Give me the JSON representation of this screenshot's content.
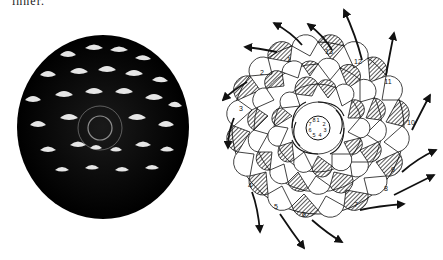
{
  "header": {
    "cut_text": "inner."
  },
  "photo": {
    "subject": "pine cone viewed from base",
    "tone": "black-and-white halftone"
  },
  "diagram": {
    "outer_spiral_labels": [
      "1",
      "2",
      "3",
      "4",
      "5",
      "6",
      "7",
      "8",
      "9",
      "10",
      "11",
      "12",
      "13"
    ],
    "inner_spiral_labels": [
      "1",
      "2",
      "3",
      "4",
      "5",
      "6",
      "7",
      "8"
    ],
    "arrow_direction": "outward clockwise swirl",
    "colors": {
      "ink": "#111111",
      "paper": "#ffffff"
    }
  }
}
